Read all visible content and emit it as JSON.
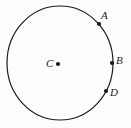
{
  "figure": {
    "type": "geometry-diagram",
    "background_color": "#fdfdfd",
    "stroke_color": "#1a1a1a",
    "circle": {
      "center_x": 60,
      "center_y": 63,
      "radius_x": 53,
      "radius_y": 57,
      "stroke_width": 1.2
    },
    "center_point": {
      "label": "C",
      "label_x": 46,
      "label_y": 58,
      "dot_x": 58,
      "dot_y": 64,
      "dot_radius": 2.1
    },
    "points": [
      {
        "label": "A",
        "label_x": 101,
        "label_y": 10,
        "dot_x": 99,
        "dot_y": 24,
        "dot_radius": 2.1
      },
      {
        "label": "B",
        "label_x": 116,
        "label_y": 55,
        "dot_x": 112,
        "dot_y": 63,
        "dot_radius": 2.1
      },
      {
        "label": "D",
        "label_x": 110,
        "label_y": 87,
        "dot_x": 106,
        "dot_y": 91,
        "dot_radius": 2.1
      }
    ]
  }
}
